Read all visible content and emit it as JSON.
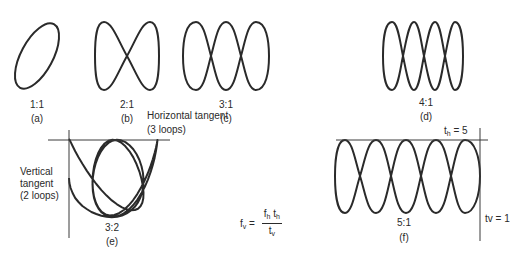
{
  "figures": {
    "a": {
      "ratio": "1:1",
      "caption": "(a)"
    },
    "b": {
      "ratio": "2:1",
      "caption": "(b)"
    },
    "c": {
      "ratio": "3:1",
      "caption": "(c)"
    },
    "d": {
      "ratio": "4:1",
      "caption": "(d)"
    },
    "e": {
      "ratio": "3:2",
      "caption": "(e)",
      "horizontal_label": "Horizontal tangent",
      "horizontal_loops": "(3 loops)",
      "vertical_label_1": "Vertical",
      "vertical_label_2": "tangent",
      "vertical_loops": "(2 loops)"
    },
    "f": {
      "ratio": "5:1",
      "caption": "(f)",
      "th_label": "t",
      "th_sub": "h",
      "th_value": " = 5",
      "tv_label": "tv = 1"
    }
  },
  "formula": {
    "lhs": "f",
    "lhs_sub": "v",
    "equals": " = ",
    "num_f": "f",
    "num_f_sub": "h",
    "num_t": "t",
    "num_t_sub": "h",
    "den_t": "t",
    "den_t_sub": "v"
  },
  "style": {
    "stroke": "#2a2a2a",
    "background": "#ffffff"
  }
}
